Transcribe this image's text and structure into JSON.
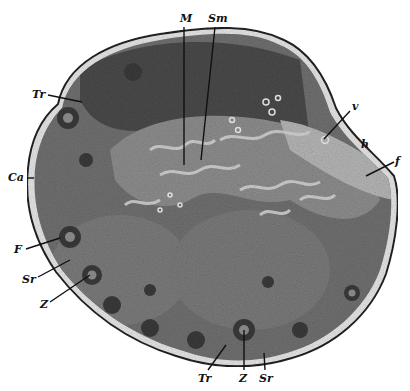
{
  "figure": {
    "colors": {
      "background": "#ffffff",
      "capsule": "#e6e6e6",
      "cortex": "#6e6e6e",
      "follicle": "#3a3a3a",
      "medulla": "#8d8d8d",
      "hilus": "#b5b5b5",
      "ink": "#111111"
    },
    "labels": [
      {
        "id": "M",
        "text": "M",
        "x": 180,
        "y": 22
      },
      {
        "id": "Sm",
        "text": "Sm",
        "x": 208,
        "y": 22
      },
      {
        "id": "Tr_top",
        "text": "Tr",
        "x": 32,
        "y": 98
      },
      {
        "id": "Ca",
        "text": "Ca",
        "x": 8,
        "y": 181
      },
      {
        "id": "v",
        "text": "v",
        "x": 352,
        "y": 110
      },
      {
        "id": "h",
        "text": "h",
        "x": 361,
        "y": 148
      },
      {
        "id": "f",
        "text": "f",
        "x": 395,
        "y": 165
      },
      {
        "id": "F",
        "text": "F",
        "x": 14,
        "y": 253
      },
      {
        "id": "Sr_left",
        "text": "Sr",
        "x": 22,
        "y": 283
      },
      {
        "id": "Z_left",
        "text": "Z",
        "x": 40,
        "y": 308
      },
      {
        "id": "Tr_bottom",
        "text": "Tr",
        "x": 198,
        "y": 382
      },
      {
        "id": "Z_bottom",
        "text": "Z",
        "x": 239,
        "y": 382
      },
      {
        "id": "Sr_bottom",
        "text": "Sr",
        "x": 259,
        "y": 382
      }
    ]
  }
}
